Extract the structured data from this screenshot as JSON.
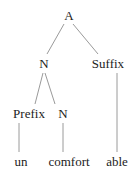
{
  "tree": {
    "nodes": [
      {
        "id": "A",
        "label": "A",
        "x": 69,
        "y": 20
      },
      {
        "id": "N1",
        "label": "N",
        "x": 44,
        "y": 68
      },
      {
        "id": "Suffix",
        "label": "Suffix",
        "x": 108,
        "y": 68
      },
      {
        "id": "Prefix",
        "label": "Prefix",
        "x": 29,
        "y": 118
      },
      {
        "id": "N2",
        "label": "N",
        "x": 63,
        "y": 118
      },
      {
        "id": "un",
        "label": "un",
        "x": 21,
        "y": 166
      },
      {
        "id": "comfort",
        "label": "comfort",
        "x": 69,
        "y": 166
      },
      {
        "id": "able",
        "label": "able",
        "x": 117,
        "y": 166
      }
    ],
    "edges": [
      [
        "A",
        "N1"
      ],
      [
        "A",
        "Suffix"
      ],
      [
        "N1",
        "Prefix"
      ],
      [
        "N1",
        "N2"
      ],
      [
        "Prefix",
        "un"
      ],
      [
        "N2",
        "comfort"
      ],
      [
        "Suffix",
        "able"
      ]
    ]
  },
  "colors": {
    "text": "#222222",
    "edge": "#9a9a9a"
  }
}
